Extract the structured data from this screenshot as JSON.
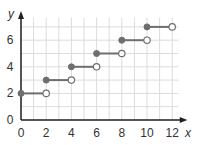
{
  "chart_data": {
    "type": "line",
    "subtype": "step",
    "title": "",
    "xlabel": "x",
    "ylabel": "y",
    "xlim": [
      0,
      12
    ],
    "ylim": [
      0,
      7.5
    ],
    "x_ticks": [
      "0",
      "2",
      "4",
      "6",
      "8",
      "10",
      "12"
    ],
    "y_ticks": [
      "0",
      "2",
      "4",
      "6"
    ],
    "grid": true,
    "segments": [
      {
        "x_start": 0,
        "x_end": 2,
        "y": 2,
        "start": "closed",
        "end": "open"
      },
      {
        "x_start": 2,
        "x_end": 4,
        "y": 3,
        "start": "closed",
        "end": "open"
      },
      {
        "x_start": 4,
        "x_end": 6,
        "y": 4,
        "start": "closed",
        "end": "open"
      },
      {
        "x_start": 6,
        "x_end": 8,
        "y": 5,
        "start": "closed",
        "end": "open"
      },
      {
        "x_start": 8,
        "x_end": 10,
        "y": 6,
        "start": "closed",
        "end": "open"
      },
      {
        "x_start": 10,
        "x_end": 12,
        "y": 7,
        "start": "closed",
        "end": "open"
      }
    ],
    "colors": {
      "line": "#6e6e6e",
      "grid": "#dcdcdc",
      "axis": "#222222"
    }
  }
}
